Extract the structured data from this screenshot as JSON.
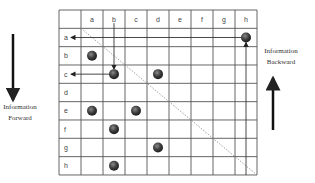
{
  "diagram": {
    "columns": [
      "a",
      "b",
      "c",
      "d",
      "e",
      "f",
      "g",
      "h"
    ],
    "rows": [
      "a",
      "b",
      "c",
      "d",
      "e",
      "f",
      "g",
      "h"
    ],
    "dots": [
      {
        "row": "a",
        "col": "h"
      },
      {
        "row": "b",
        "col": "a"
      },
      {
        "row": "c",
        "col": "b"
      },
      {
        "row": "c",
        "col": "d"
      },
      {
        "row": "e",
        "col": "a"
      },
      {
        "row": "e",
        "col": "c"
      },
      {
        "row": "f",
        "col": "b"
      },
      {
        "row": "g",
        "col": "d"
      },
      {
        "row": "h",
        "col": "b"
      }
    ],
    "arrows": [
      {
        "from": "dot a-h",
        "to": "row label a",
        "direction": "left"
      },
      {
        "from": "column header b",
        "to": "dot c-b",
        "direction": "down"
      },
      {
        "from": "dot c-b",
        "to": "row label c",
        "direction": "left"
      },
      {
        "from": "bottom of column h",
        "to": "dot a-h",
        "direction": "up"
      }
    ],
    "diagonal": "dashed",
    "left_label": {
      "line1": "Information",
      "line2": "Forward"
    },
    "right_label": {
      "line1": "Information",
      "line2": "Backward"
    },
    "colors": {
      "grid": "#555555",
      "dot": "#3a3a3a",
      "text": "#444444"
    }
  }
}
